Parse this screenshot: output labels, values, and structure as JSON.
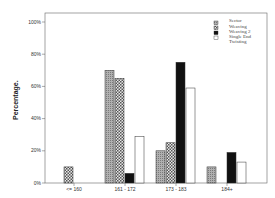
{
  "chart_data": {
    "type": "bar",
    "title": "",
    "xlabel": "",
    "ylabel": "Percentage.",
    "ylim": [
      0,
      100
    ],
    "yticks": [
      "0%",
      "20%",
      "40%",
      "60%",
      "80%",
      "100%"
    ],
    "categories": [
      "<= 160",
      "161 - 172",
      "173 - 183",
      "184+"
    ],
    "legend_title": "Sector",
    "legend_position": "top-right",
    "grid": false,
    "series": [
      {
        "name": "Weaving",
        "pattern": "gray-hatch",
        "values": [
          0,
          70,
          20,
          10
        ]
      },
      {
        "name": "Weaving 2",
        "pattern": "checker",
        "values": [
          10,
          65,
          25,
          0
        ]
      },
      {
        "name": "Single End",
        "pattern": "black",
        "values": [
          0,
          6,
          75,
          19
        ]
      },
      {
        "name": "Twisting",
        "pattern": "white",
        "values": [
          0,
          29,
          59,
          13
        ]
      }
    ]
  }
}
